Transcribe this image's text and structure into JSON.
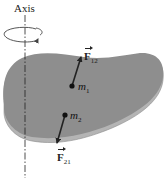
{
  "figure": {
    "axis_label": "Axis",
    "masses": [
      {
        "name": "m",
        "subscript": "1"
      },
      {
        "name": "m",
        "subscript": "2"
      }
    ],
    "forces": [
      {
        "name": "F",
        "subscript": "12"
      },
      {
        "name": "F",
        "subscript": "21"
      }
    ],
    "colors": {
      "disk_top": "#8e8e8e",
      "disk_rim": "#b4b4b4",
      "ink": "#222222"
    }
  }
}
